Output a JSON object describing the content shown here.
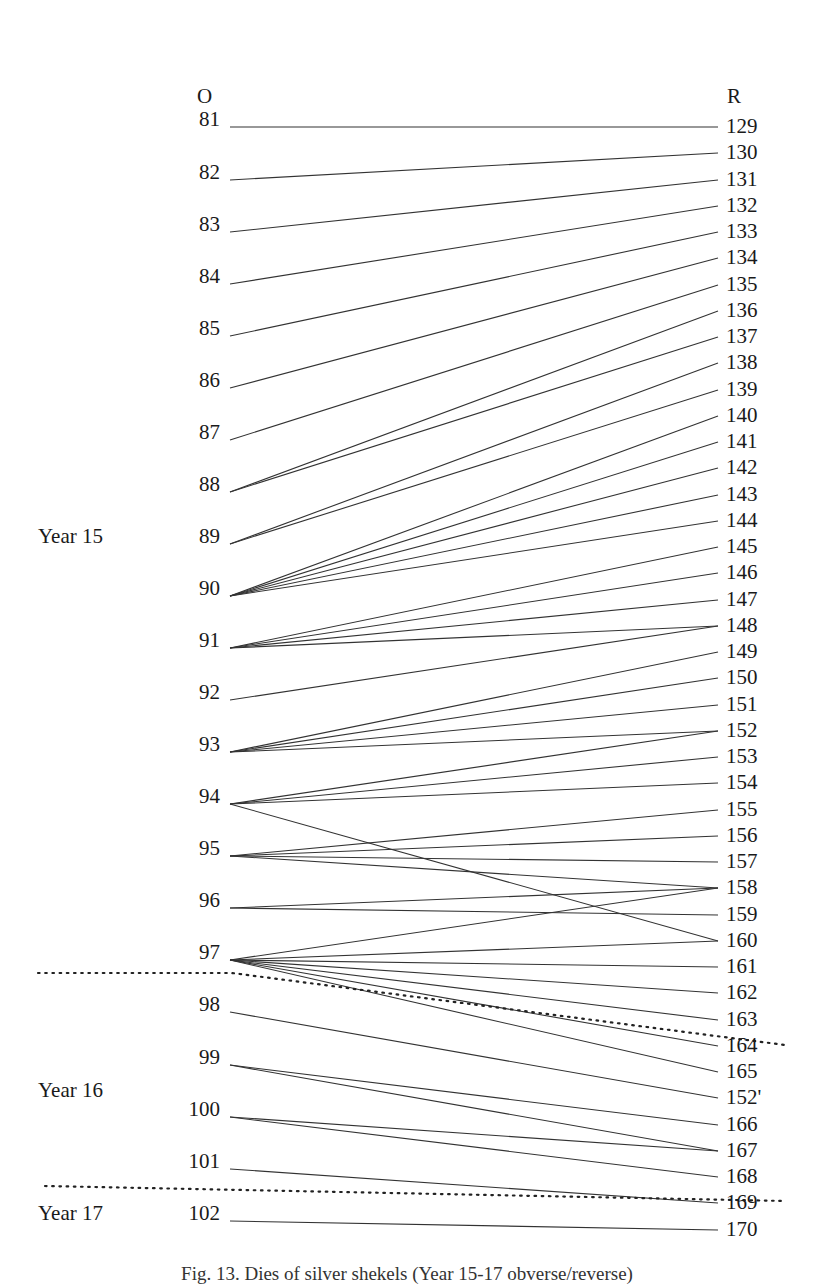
{
  "figure": {
    "header_left": "O",
    "header_right": "R",
    "caption": "Fig. 13. Dies of silver shekels (Year 15-17 obverse/reverse)",
    "year_labels": [
      {
        "label": "Year 15",
        "y": 544
      },
      {
        "label": "Year 16",
        "y": 1098
      },
      {
        "label": "Year 17",
        "y": 1221
      }
    ],
    "separators": [
      {
        "name": "year-15-16-separator",
        "points": [
          [
            38,
            973
          ],
          [
            232,
            973
          ],
          [
            785,
            1045
          ]
        ]
      },
      {
        "name": "year-16-17-separator",
        "points": [
          [
            45,
            1186
          ],
          [
            785,
            1201
          ]
        ]
      }
    ]
  },
  "chart_data": {
    "type": "die-link diagram",
    "left_axis_label": "O",
    "right_axis_label": "R",
    "obverse": [
      {
        "id": "81",
        "y": 127,
        "year": "Year 15"
      },
      {
        "id": "82",
        "y": 180,
        "year": "Year 15"
      },
      {
        "id": "83",
        "y": 232,
        "year": "Year 15"
      },
      {
        "id": "84",
        "y": 284,
        "year": "Year 15"
      },
      {
        "id": "85",
        "y": 336,
        "year": "Year 15"
      },
      {
        "id": "86",
        "y": 388,
        "year": "Year 15"
      },
      {
        "id": "87",
        "y": 440,
        "year": "Year 15"
      },
      {
        "id": "88",
        "y": 492,
        "year": "Year 15"
      },
      {
        "id": "89",
        "y": 544,
        "year": "Year 15"
      },
      {
        "id": "90",
        "y": 596,
        "year": "Year 15"
      },
      {
        "id": "91",
        "y": 648,
        "year": "Year 15"
      },
      {
        "id": "92",
        "y": 700,
        "year": "Year 15"
      },
      {
        "id": "93",
        "y": 752,
        "year": "Year 15"
      },
      {
        "id": "94",
        "y": 804,
        "year": "Year 15"
      },
      {
        "id": "95",
        "y": 856,
        "year": "Year 15"
      },
      {
        "id": "96",
        "y": 908,
        "year": "Year 15"
      },
      {
        "id": "97",
        "y": 960,
        "year": "Year 15"
      },
      {
        "id": "98",
        "y": 1012,
        "year": "Year 16"
      },
      {
        "id": "99",
        "y": 1065,
        "year": "Year 16"
      },
      {
        "id": "100",
        "y": 1117,
        "year": "Year 16"
      },
      {
        "id": "101",
        "y": 1169,
        "year": "Year 16"
      },
      {
        "id": "102",
        "y": 1221,
        "year": "Year 17"
      }
    ],
    "reverse": [
      {
        "id": "129",
        "y": 127
      },
      {
        "id": "130",
        "y": 153
      },
      {
        "id": "131",
        "y": 180
      },
      {
        "id": "132",
        "y": 206
      },
      {
        "id": "133",
        "y": 232
      },
      {
        "id": "134",
        "y": 258
      },
      {
        "id": "135",
        "y": 285
      },
      {
        "id": "136",
        "y": 311
      },
      {
        "id": "137",
        "y": 337
      },
      {
        "id": "138",
        "y": 363
      },
      {
        "id": "139",
        "y": 390
      },
      {
        "id": "140",
        "y": 416
      },
      {
        "id": "141",
        "y": 442
      },
      {
        "id": "142",
        "y": 468
      },
      {
        "id": "143",
        "y": 495
      },
      {
        "id": "144",
        "y": 521
      },
      {
        "id": "145",
        "y": 547
      },
      {
        "id": "146",
        "y": 573
      },
      {
        "id": "147",
        "y": 600
      },
      {
        "id": "148",
        "y": 626
      },
      {
        "id": "149",
        "y": 652
      },
      {
        "id": "150",
        "y": 678
      },
      {
        "id": "151",
        "y": 705
      },
      {
        "id": "152",
        "y": 731
      },
      {
        "id": "153",
        "y": 757
      },
      {
        "id": "154",
        "y": 783
      },
      {
        "id": "155",
        "y": 810
      },
      {
        "id": "156",
        "y": 836
      },
      {
        "id": "157",
        "y": 862
      },
      {
        "id": "158",
        "y": 888
      },
      {
        "id": "159",
        "y": 915
      },
      {
        "id": "160",
        "y": 941
      },
      {
        "id": "161",
        "y": 967
      },
      {
        "id": "162",
        "y": 993
      },
      {
        "id": "163",
        "y": 1020
      },
      {
        "id": "164",
        "y": 1046
      },
      {
        "id": "165",
        "y": 1072
      },
      {
        "id": "152'",
        "y": 1098
      },
      {
        "id": "166",
        "y": 1125
      },
      {
        "id": "167",
        "y": 1151
      },
      {
        "id": "168",
        "y": 1177
      },
      {
        "id": "169",
        "y": 1203
      },
      {
        "id": "170",
        "y": 1230
      }
    ],
    "links": [
      [
        "81",
        "129"
      ],
      [
        "82",
        "130"
      ],
      [
        "83",
        "131"
      ],
      [
        "84",
        "132"
      ],
      [
        "85",
        "133"
      ],
      [
        "86",
        "134"
      ],
      [
        "87",
        "135"
      ],
      [
        "88",
        "136"
      ],
      [
        "88",
        "137"
      ],
      [
        "89",
        "138"
      ],
      [
        "89",
        "139"
      ],
      [
        "90",
        "140"
      ],
      [
        "90",
        "141"
      ],
      [
        "90",
        "142"
      ],
      [
        "90",
        "143"
      ],
      [
        "90",
        "144"
      ],
      [
        "91",
        "145"
      ],
      [
        "91",
        "146"
      ],
      [
        "91",
        "147"
      ],
      [
        "91",
        "148"
      ],
      [
        "92",
        "148"
      ],
      [
        "93",
        "149"
      ],
      [
        "93",
        "150"
      ],
      [
        "93",
        "151"
      ],
      [
        "93",
        "152"
      ],
      [
        "94",
        "152"
      ],
      [
        "94",
        "153"
      ],
      [
        "94",
        "154"
      ],
      [
        "94",
        "160"
      ],
      [
        "95",
        "155"
      ],
      [
        "95",
        "156"
      ],
      [
        "95",
        "157"
      ],
      [
        "95",
        "158"
      ],
      [
        "96",
        "158"
      ],
      [
        "96",
        "159"
      ],
      [
        "97",
        "158"
      ],
      [
        "97",
        "160"
      ],
      [
        "97",
        "161"
      ],
      [
        "97",
        "162"
      ],
      [
        "97",
        "163"
      ],
      [
        "97",
        "164"
      ],
      [
        "97",
        "165"
      ],
      [
        "98",
        "152'"
      ],
      [
        "99",
        "166"
      ],
      [
        "99",
        "167"
      ],
      [
        "100",
        "167"
      ],
      [
        "100",
        "168"
      ],
      [
        "101",
        "169"
      ],
      [
        "102",
        "170"
      ]
    ],
    "layout": {
      "left_line_x": 230,
      "right_line_x": 718,
      "left_label_right_edge": 220,
      "right_label_x": 726,
      "line_color": "#333333",
      "dotted_color": "#222222"
    }
  }
}
